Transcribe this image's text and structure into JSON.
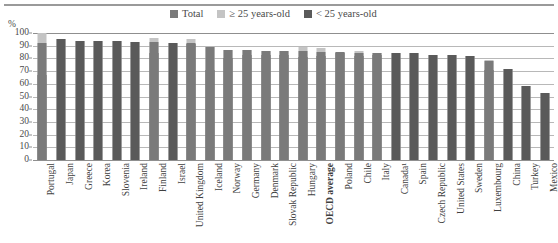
{
  "axis_unit": "%",
  "legend": {
    "items": [
      {
        "label": "Total",
        "color": "#7a7a7a",
        "icon": "square-swatch-icon"
      },
      {
        "label": "≥ 25 years-old",
        "color": "#c4c4c4",
        "icon": "square-swatch-icon"
      },
      {
        "label": "< 25 years-old",
        "color": "#5a5a5a",
        "icon": "square-swatch-icon"
      }
    ]
  },
  "colors": {
    "total": "#7a7a7a",
    "over25": "#c4c4c4",
    "under25": "#5a5a5a",
    "gridline": "#b8b8b8",
    "axis": "#8f8f8f",
    "text": "#3f3f3f",
    "background": "#ffffff"
  },
  "chart_data": {
    "type": "bar",
    "title": "",
    "subtitle": "",
    "xlabel": "",
    "ylabel": "%",
    "ylim": [
      0,
      100
    ],
    "yticks": [
      0,
      10,
      20,
      30,
      40,
      50,
      60,
      70,
      80,
      90,
      100
    ],
    "grid": true,
    "legend_position": "top-center",
    "highlight_category": "OECD average",
    "categories": [
      "Portugal",
      "Japan",
      "Greece",
      "Korea",
      "Slovenia",
      "Ireland",
      "Finland",
      "Israel",
      "United Kingdom",
      "Iceland",
      "Norway",
      "Germany",
      "Denmark",
      "Slovak Republic",
      "Hungary",
      "OECD average",
      "Poland",
      "Chile",
      "Italy",
      "Canada¹",
      "Spain",
      "Czech Republic",
      "United States",
      "Sweden",
      "Luxembourg",
      "China",
      "Turkey",
      "Mexico"
    ],
    "series": [
      {
        "name": "Total",
        "values": [
          92,
          95,
          94,
          94,
          94,
          93,
          93,
          92,
          92,
          89,
          87,
          87,
          86,
          86,
          86,
          85,
          85,
          84,
          84,
          84,
          84,
          83,
          83,
          82,
          78,
          72,
          58,
          53
        ]
      },
      {
        "name": "≥ 25 years-old",
        "values": [
          100,
          95,
          94,
          94,
          94,
          93,
          96,
          92,
          95,
          89,
          87,
          87,
          86,
          86,
          89,
          88,
          85,
          86,
          84,
          84,
          84,
          83,
          83,
          82,
          79,
          72,
          58,
          53
        ]
      },
      {
        "name": "< 25 years-old",
        "values": [
          67,
          95,
          94,
          94,
          94,
          93,
          84,
          92,
          91,
          71,
          80,
          83,
          83,
          83,
          81,
          82,
          84,
          82,
          83,
          84,
          84,
          83,
          83,
          82,
          71,
          72,
          58,
          53
        ]
      }
    ]
  }
}
